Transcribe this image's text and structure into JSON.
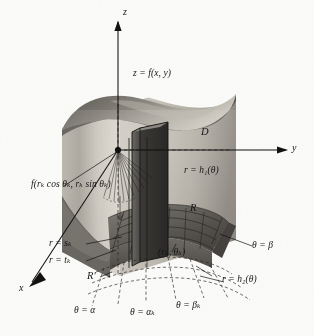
{
  "figure": {
    "background_color": "#fbfbf9",
    "ink_color": "#161616"
  },
  "axes": [
    {
      "id": "z",
      "label": "z",
      "direction": "up"
    },
    {
      "id": "y",
      "label": "y",
      "direction": "right"
    },
    {
      "id": "x",
      "label": "x",
      "direction": "lower-left"
    }
  ],
  "labels": {
    "surface": "z = f(x, y)",
    "domain_top": "D",
    "inner_boundary": "r = h₁(θ)",
    "outer_boundary": "r = h₂(θ)",
    "sample_height": "f(rₖ cos θₖ, rₖ sin θₖ)",
    "radius_outer": "r = sₖ",
    "radius_inner": "r = tₖ",
    "region_R": "R",
    "region_Rprime": "R′",
    "sample_point": "(rₖ, θₖ)",
    "theta_alpha": "θ = α",
    "theta_alpha_k": "θ = αₖ",
    "theta_beta_k": "θ = βₖ",
    "theta_beta": "θ = β"
  },
  "label_parts": {
    "surface": {
      "lhs": "z",
      "eq": "=",
      "rhs": "f(x, y)"
    },
    "inner_boundary": {
      "lhs": "r",
      "eq": "=",
      "fn": "h",
      "sub": "1",
      "arg": "(θ)"
    },
    "outer_boundary": {
      "lhs": "r",
      "eq": "=",
      "fn": "h",
      "sub": "2",
      "arg": "(θ)"
    },
    "radius_outer": {
      "lhs": "r",
      "eq": "=",
      "fn": "s",
      "sub": "k"
    },
    "radius_inner": {
      "lhs": "r",
      "eq": "=",
      "fn": "t",
      "sub": "k"
    }
  },
  "colors": {
    "surface_dark": "#6f6c66",
    "surface_mid": "#9b978f",
    "surface_light": "#c9c5bc",
    "wall_front": "#8d8a83",
    "base_dark": "#5d5a55",
    "base_mid": "#76736d",
    "prism_dark": "#3b3936",
    "prism_side": "#5a5854",
    "dashed": "#2a2a28"
  }
}
